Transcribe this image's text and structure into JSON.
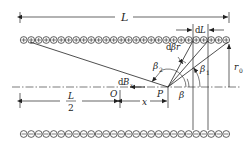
{
  "diagram": {
    "colors": {
      "ink": "#222222",
      "background": "#ffffff"
    },
    "labels": {
      "length": "L",
      "element": "dL",
      "element_d": "d",
      "element_L": "L",
      "dbeta_r": "dβr",
      "dbeta_d": "d",
      "dbeta_rest": "βr",
      "beta2": "β",
      "beta2_sub": "2",
      "beta1": "β",
      "beta1_sub": "1",
      "beta": "β",
      "radius": "r",
      "radius_sub": "0",
      "dBx": "B",
      "dBx_d": "d",
      "dBx_sub": "x",
      "origin": "O",
      "point": "P",
      "half_num": "L",
      "half_den": "2",
      "x_dist": "x"
    },
    "top_row": {
      "count": 28,
      "symbol": "plus",
      "label": "current out (⊕)"
    },
    "bottom_row": {
      "count": 28,
      "symbol": "minus",
      "label": "current in (⊖)"
    }
  }
}
